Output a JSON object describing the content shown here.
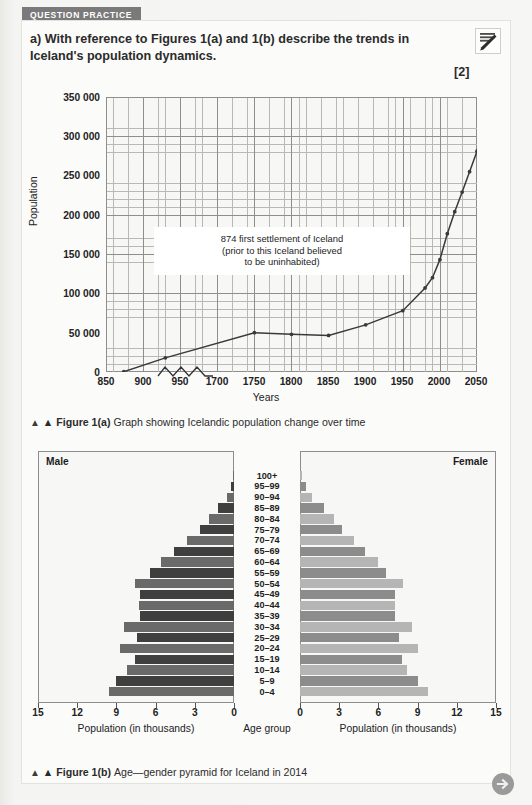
{
  "header": {
    "tag": "QUESTION PRACTICE",
    "question_lead": "a)",
    "question_text": "With reference to Figures 1(a) and 1(b) describe the trends in Iceland's population dynamics.",
    "marks": "[2]",
    "pencil_icon": "pencil-write-icon"
  },
  "figure_a": {
    "caption_label": "▲ Figure 1(a)",
    "caption_text": "Graph showing Icelandic population change over time",
    "annotation": [
      "874 first settlement of Iceland",
      "(prior to this Iceland believed",
      "to be uninhabited)"
    ]
  },
  "figure_b": {
    "caption_label": "▲ Figure 1(b)",
    "caption_text": "Age—gender pyramid for Iceland in 2014",
    "male_label": "Male",
    "female_label": "Female",
    "age_axis_label": "Age group",
    "male_axis_label": "Population (in thousands)",
    "female_axis_label": "Population (in thousands)"
  },
  "footer": {
    "next_icon": "arrow-right-circle-icon"
  },
  "colors": {
    "tag_bg": "#7a7a7a",
    "card_bg": "#fbfbfa",
    "page_bg": "#f1f1ef",
    "grid_minor": "#b9b9b4",
    "grid_major": "#8f8f8a",
    "line": "#3a3a3a",
    "male_dark": "#3f3f3f",
    "male_mid": "#6a6a6a",
    "female_mid": "#8c8c8c",
    "female_light": "#b5b5b5",
    "next_btn": "#9a9a9a"
  },
  "chart_data": [
    {
      "type": "line",
      "title": "Graph showing Icelandic population change over time",
      "xlabel": "Years",
      "ylabel": "Population",
      "ylim": [
        0,
        350000
      ],
      "yticks": [
        0,
        50000,
        100000,
        150000,
        200000,
        250000,
        300000,
        350000
      ],
      "ytick_labels": [
        "0",
        "50 000",
        "100 000",
        "150 000",
        "200 000",
        "250 000",
        "300 000",
        "350 000"
      ],
      "xticks": [
        850,
        900,
        950,
        1700,
        1750,
        1800,
        1850,
        1900,
        1950,
        2000,
        2050
      ],
      "xtick_labels": [
        "850",
        "900",
        "950",
        "1700",
        "1750",
        "1800",
        "1850",
        "1900",
        "1950",
        "2000",
        "2050"
      ],
      "axis_break": {
        "between": [
          950,
          1700
        ],
        "style": "zigzag"
      },
      "grid": true,
      "legend": "none",
      "x": [
        874,
        930,
        1700,
        1750,
        1800,
        1850,
        1900,
        1930,
        1940,
        1950,
        1960,
        1970,
        1980,
        1990,
        2000,
        2010,
        2016
      ],
      "values": [
        400,
        18000,
        50000,
        48000,
        46500,
        60000,
        78000,
        107000,
        120000,
        143000,
        176000,
        204000,
        229000,
        255000,
        281000,
        318000,
        328000
      ],
      "annotations": [
        "874 first settlement of Iceland (prior to this Iceland believed to be uninhabited)"
      ]
    },
    {
      "type": "bar",
      "subtype": "population-pyramid",
      "title": "Age—gender pyramid for Iceland in 2014",
      "xlabel_left": "Population (in thousands)",
      "xlabel_center": "Age group",
      "xlabel_right": "Population (in thousands)",
      "xlim": [
        0,
        15
      ],
      "xticks": [
        15,
        12,
        9,
        6,
        3,
        0
      ],
      "xticks_right": [
        0,
        3,
        6,
        9,
        12,
        15
      ],
      "categories": [
        "100+",
        "95–99",
        "90–94",
        "85–89",
        "80–84",
        "75–79",
        "70–74",
        "65–69",
        "60–64",
        "55–59",
        "50–54",
        "45–49",
        "40–44",
        "35–39",
        "30–34",
        "25–29",
        "20–24",
        "15–19",
        "10–14",
        "5–9",
        "0–4"
      ],
      "series": [
        {
          "name": "Male",
          "values": [
            0.05,
            0.2,
            0.5,
            1.2,
            1.9,
            2.6,
            3.6,
            4.6,
            5.6,
            6.4,
            7.6,
            7.2,
            7.3,
            7.2,
            8.4,
            7.4,
            8.7,
            7.6,
            8.2,
            9.0,
            9.6
          ]
        },
        {
          "name": "Female",
          "values": [
            0.15,
            0.45,
            0.95,
            1.8,
            2.6,
            3.2,
            4.1,
            5.0,
            6.0,
            6.6,
            7.9,
            7.3,
            7.3,
            7.3,
            8.6,
            7.6,
            9.0,
            7.8,
            8.2,
            9.0,
            9.8
          ]
        }
      ]
    }
  ]
}
